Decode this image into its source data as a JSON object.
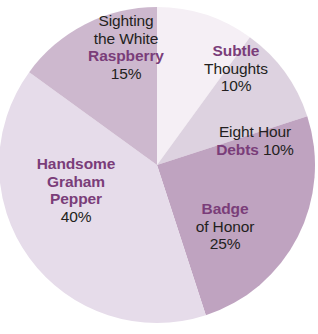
{
  "chart_data": {
    "type": "pie",
    "title": "",
    "subtitle": "",
    "xlabel": "",
    "ylabel": "",
    "legend_position": "none",
    "labels_inside_slices": true,
    "categories": [
      "Subtle Thoughts",
      "Eight Hour Debts",
      "Badge of Honor",
      "Handsome Graham Pepper",
      "Sighting the White Raspberry"
    ],
    "values": [
      10,
      10,
      25,
      40,
      15
    ],
    "unit": "%",
    "total": 100,
    "start_angle_deg": 0,
    "direction": "clockwise",
    "slices": [
      {
        "name": "Subtle Thoughts",
        "value": 10,
        "percent_text": "10%",
        "color": "#f5eff5",
        "start_deg": 0,
        "end_deg": 36
      },
      {
        "name": "Eight Hour Debts",
        "value": 10,
        "percent_text": "10%",
        "color": "#ddd2e0",
        "start_deg": 36,
        "end_deg": 72
      },
      {
        "name": "Badge of Honor",
        "value": 25,
        "percent_text": "25%",
        "color": "#bfa3c0",
        "start_deg": 72,
        "end_deg": 162
      },
      {
        "name": "Handsome Graham Pepper",
        "value": 40,
        "percent_text": "40%",
        "color": "#e6dcea",
        "start_deg": 162,
        "end_deg": 306
      },
      {
        "name": "Sighting the White Raspberry",
        "value": 15,
        "percent_text": "15%",
        "color": "#cdb8ce",
        "start_deg": 306,
        "end_deg": 360
      }
    ]
  },
  "colors": {
    "background": "#ffffff",
    "highlight_text": "#7a3d79",
    "plain_text": "#231f20",
    "slice_subtle_thoughts": "#f5eff5",
    "slice_eight_hour_debts": "#ddd2e0",
    "slice_badge_of_honor": "#bfa3c0",
    "slice_handsome_graham_pepper": "#e6dcea",
    "slice_sighting_the_white_raspberry": "#cdb8ce"
  },
  "labels": {
    "raspberry": {
      "line1": "Sighting",
      "line2": "the White",
      "line3_highlight": "Raspberry",
      "line4_percent": "15%"
    },
    "subtle": {
      "line1_highlight": "Subtle",
      "line2": "Thoughts",
      "line3_percent": "10%"
    },
    "debts": {
      "line1": "Eight Hour",
      "line2_highlight": "Debts",
      "line2_percent": " 10%"
    },
    "badge": {
      "line1_highlight": "Badge",
      "line2": "of Honor",
      "line3_percent": "25%"
    },
    "pepper": {
      "line1_highlight": "Handsome",
      "line2_highlight": "Graham",
      "line3_highlight": "Pepper",
      "line4_percent": "40%"
    }
  }
}
